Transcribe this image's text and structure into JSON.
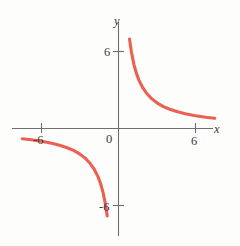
{
  "figure": {
    "background_color": "#fdfdfc",
    "axis_color": "#6e6e70",
    "curve_color": "#ec6053",
    "origin_label": "0",
    "x_axis_label": "x",
    "y_axis_label": "y"
  },
  "chart_data": {
    "type": "line",
    "title": "",
    "xlabel": "x",
    "ylabel": "y",
    "grid": false,
    "legend": null,
    "xlim": [
      -9.2,
      9.5
    ],
    "ylim": [
      -9.2,
      7.4
    ],
    "xticks": [
      -6,
      6
    ],
    "xticklabels": [
      "-6",
      "6"
    ],
    "yticks": [
      6,
      -6
    ],
    "yticklabels": [
      "6",
      "-6"
    ],
    "origin_tick_label": "0",
    "equation": "y = 6/x",
    "series": [
      {
        "name": "branch-1",
        "quadrant": "I",
        "x": [
          0.86,
          1.0,
          1.2,
          1.4,
          1.6,
          1.9,
          2.2,
          2.6,
          3.0,
          3.5,
          4.0,
          4.6,
          5.2,
          6.0,
          6.8,
          7.5
        ],
        "y": [
          6.98,
          6.0,
          5.0,
          4.29,
          3.75,
          3.16,
          2.73,
          2.31,
          2.0,
          1.71,
          1.5,
          1.3,
          1.15,
          1.0,
          0.88,
          0.8
        ]
      },
      {
        "name": "branch-2",
        "quadrant": "III",
        "x": [
          -7.5,
          -6.8,
          -6.0,
          -5.2,
          -4.6,
          -4.0,
          -3.5,
          -3.0,
          -2.6,
          -2.2,
          -1.9,
          -1.6,
          -1.4,
          -1.2,
          -1.0,
          -0.88
        ],
        "y": [
          -0.8,
          -0.88,
          -1.0,
          -1.15,
          -1.3,
          -1.5,
          -1.71,
          -2.0,
          -2.31,
          -2.73,
          -3.16,
          -3.75,
          -4.29,
          -5.0,
          -6.0,
          -6.82
        ]
      }
    ]
  }
}
